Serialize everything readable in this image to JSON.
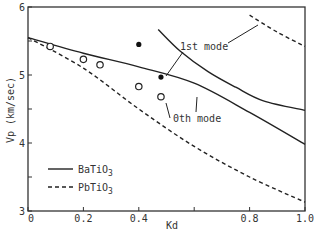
{
  "chart_data": {
    "type": "line",
    "title": "",
    "xlabel": "Kd",
    "ylabel": "Vp (km/sec)",
    "xlim": [
      0,
      1.0
    ],
    "ylim": [
      3,
      6
    ],
    "x_ticks": [
      0,
      0.2,
      0.4,
      0.6,
      0.8,
      1.0
    ],
    "x_tick_labels": [
      "0",
      "0.2",
      "0.4",
      "",
      "0.8",
      "1.0"
    ],
    "y_ticks": [
      3,
      3.5,
      4,
      4.5,
      5,
      5.5,
      6
    ],
    "y_tick_labels": [
      "3",
      "",
      "4",
      "",
      "5",
      "",
      "6"
    ],
    "grid": false,
    "legend_position": "bottom-left",
    "legend": [
      {
        "name": "BaTiO3",
        "base": "BaTiO",
        "sub": "3",
        "style": "solid"
      },
      {
        "name": "PbTiO3",
        "base": "PbTiO",
        "sub": "3",
        "style": "dashed"
      }
    ],
    "series": [
      {
        "name": "BaTiO3 0th mode",
        "style": "solid",
        "x": [
          0,
          0.2,
          0.4,
          0.6,
          0.8,
          1.0
        ],
        "y": [
          5.55,
          5.32,
          5.12,
          4.88,
          4.45,
          3.98
        ]
      },
      {
        "name": "BaTiO3 1st mode",
        "style": "solid",
        "x": [
          0.47,
          0.55,
          0.65,
          0.75,
          0.85,
          1.0
        ],
        "y": [
          5.67,
          5.35,
          5.05,
          4.82,
          4.62,
          4.48
        ]
      },
      {
        "name": "PbTiO3 0th mode",
        "style": "dashed",
        "x": [
          0,
          0.2,
          0.4,
          0.6,
          0.8,
          1.0
        ],
        "y": [
          5.55,
          5.1,
          4.5,
          3.95,
          3.5,
          3.13
        ]
      },
      {
        "name": "PbTiO3 1st mode",
        "style": "dashed",
        "x": [
          0.8,
          0.9,
          1.0
        ],
        "y": [
          5.88,
          5.63,
          5.42
        ]
      }
    ],
    "measured_open": {
      "name": "measured (0th mode)",
      "x": [
        0.08,
        0.2,
        0.26,
        0.4,
        0.48
      ],
      "y": [
        5.42,
        5.23,
        5.15,
        4.83,
        4.68
      ]
    },
    "measured_filled": {
      "name": "measured (1st mode)",
      "x": [
        0.4,
        0.48
      ],
      "y": [
        5.45,
        4.97
      ]
    },
    "annotations": [
      {
        "text": "1st mode",
        "x": 0.6,
        "y": 5.28
      },
      {
        "text": "0th mode",
        "x": 0.5,
        "y": 4.45
      }
    ]
  }
}
